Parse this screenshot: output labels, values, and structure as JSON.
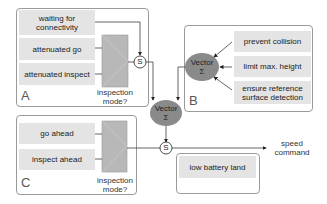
{
  "groups": {
    "A": {
      "label": "A",
      "behaviors": [
        "waiting for connectivity",
        "attenuated go",
        "attenuated inspect"
      ],
      "switch_label": "inspection mode?"
    },
    "B": {
      "label": "B",
      "behaviors": [
        "prevent collision",
        "limit max. height",
        "ensure reference surface detection"
      ],
      "combiner": {
        "line1": "Vector",
        "line2": "Σ"
      }
    },
    "C": {
      "label": "C",
      "behaviors": [
        "go ahead",
        "inspect ahead"
      ],
      "switch_label": "inspection mode?"
    },
    "D": {
      "behaviors": [
        "low battery land"
      ]
    }
  },
  "nodes": {
    "suppress_1": "S",
    "suppress_2": "S",
    "vector_sum_main": {
      "line1": "Vector",
      "line2": "Σ"
    }
  },
  "output": {
    "label": "speed command"
  },
  "colors": {
    "behavior_fill": "#e4e4e4",
    "switch_fill": "#b8b8b8",
    "ellipse_fill": "#8a8a8a",
    "border": "#9a9a9a",
    "wire": "#222222"
  }
}
